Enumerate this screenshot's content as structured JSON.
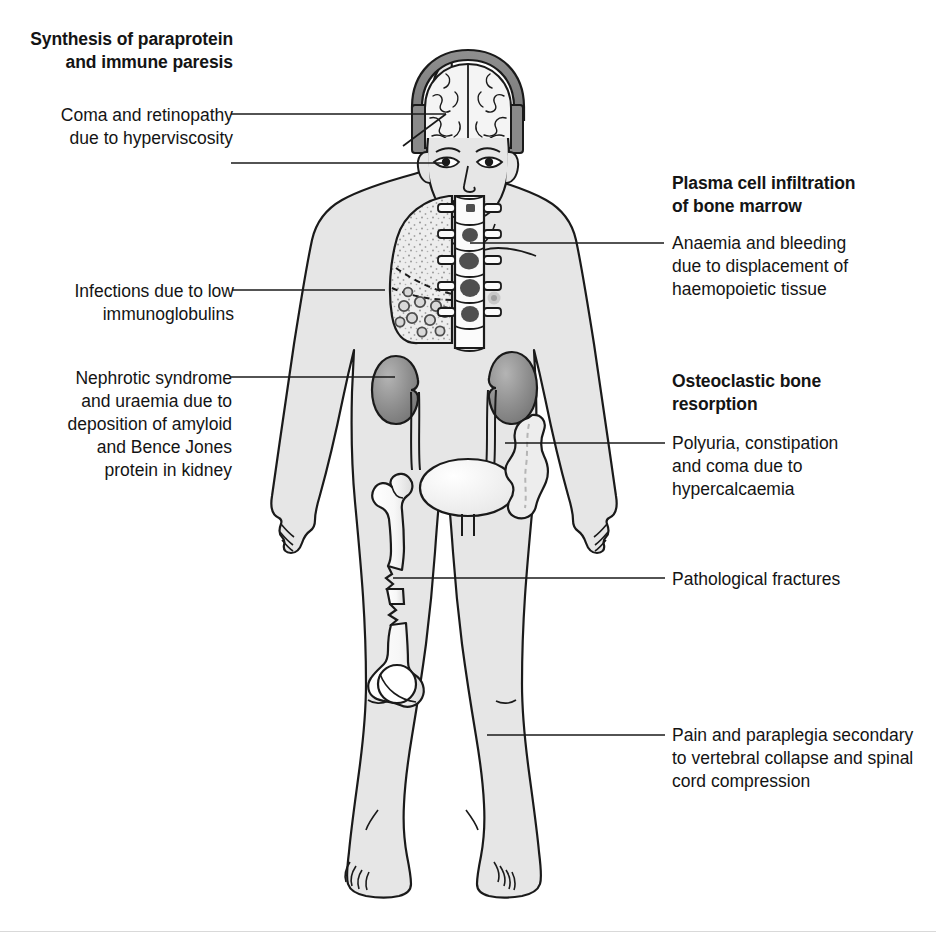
{
  "diagram": {
    "title_semantic": "Clinical features of multiple myeloma"
  },
  "headings": {
    "left_top": "Synthesis of paraprotein\nand immune paresis",
    "right_top": "Plasma cell infiltration\nof bone marrow",
    "right_mid": "Osteoclastic bone\nresorption"
  },
  "labels": {
    "coma_retinopathy": "Coma and retinopathy\ndue to hyperviscosity",
    "infections": "Infections due to low\nimmunoglobulins",
    "nephrotic": "Nephrotic syndrome\nand uraemia due to\ndeposition of amyloid\nand Bence Jones\nprotein in kidney",
    "anaemia": "Anaemia and bleeding\ndue to displacement of\nhaemopoietic tissue",
    "polyuria": "Polyuria, constipation\nand coma due to\nhypercalcaemia",
    "fractures": "Pathological fractures",
    "paraplegia": "Pain and paraplegia secondary\nto vertebral collapse and spinal\ncord compression"
  },
  "anatomy": {
    "brain": "brain",
    "skull": "skull cutaway",
    "eye": "eye",
    "lung": "lung with infection foci",
    "spine": "vertebral column with plasma cell lesions",
    "kidney_left": "left kidney",
    "kidney_right": "right kidney",
    "ureter": "ureter",
    "bladder": "urinary bladder",
    "colon": "colon",
    "femur": "femur with pathological fractures",
    "nipple": "nipple"
  },
  "colors": {
    "body_fill": "#e6e6e6",
    "outline": "#1a1a1a",
    "organ_dark": "#8a8a8a",
    "organ_light": "#f2f2f2",
    "lesion": "#555555",
    "leader_line": "#1a1a1a",
    "background": "#ffffff"
  }
}
